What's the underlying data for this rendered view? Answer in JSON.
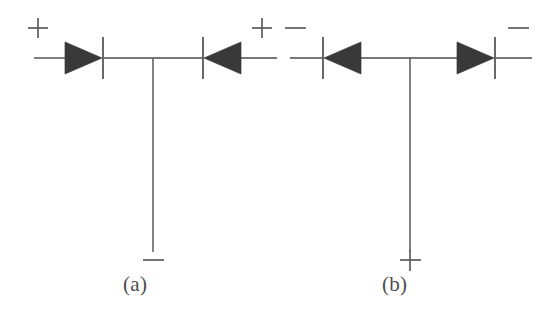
{
  "figure": {
    "background_color": "#ffffff",
    "ink_color": "#3c3c3c",
    "width": 557,
    "height": 326
  },
  "panels": [
    {
      "id": "a",
      "caption": "(a)",
      "caption_x": 123,
      "caption_y": 272,
      "baseline_y": 58,
      "wire_left_x": 34,
      "wire_right_x": 277,
      "junction_x": 153,
      "junction_bottom_y": 252,
      "terminals": [
        {
          "name": "left-terminal",
          "sign": "+",
          "sign_label": "plus",
          "x": 38,
          "y": 28
        },
        {
          "name": "right-terminal",
          "sign": "+",
          "sign_label": "plus",
          "x": 262,
          "y": 28
        },
        {
          "name": "bottom-terminal",
          "sign": "−",
          "sign_label": "minus",
          "x": 153,
          "y": 260
        }
      ],
      "diodes": [
        {
          "name": "diode-a-left",
          "direction": "right",
          "anode_x": 65,
          "tip_x": 102,
          "bar_x": 103,
          "half_height": 16,
          "bar_half_height": 21
        },
        {
          "name": "diode-a-right",
          "direction": "left",
          "anode_x": 241,
          "tip_x": 204,
          "bar_x": 203,
          "half_height": 16,
          "bar_half_height": 21
        }
      ]
    },
    {
      "id": "b",
      "caption": "(b)",
      "caption_x": 382,
      "caption_y": 272,
      "baseline_y": 58,
      "wire_left_x": 290,
      "wire_right_x": 532,
      "junction_x": 410,
      "junction_bottom_y": 252,
      "terminals": [
        {
          "name": "left-terminal",
          "sign": "−",
          "sign_label": "minus",
          "x": 295,
          "y": 28
        },
        {
          "name": "right-terminal",
          "sign": "−",
          "sign_label": "minus",
          "x": 518,
          "y": 28
        },
        {
          "name": "bottom-terminal",
          "sign": "+",
          "sign_label": "plus",
          "x": 410,
          "y": 260
        }
      ],
      "diodes": [
        {
          "name": "diode-b-left",
          "direction": "left",
          "anode_x": 361,
          "tip_x": 324,
          "bar_x": 323,
          "half_height": 16,
          "bar_half_height": 21
        },
        {
          "name": "diode-b-right",
          "direction": "right",
          "anode_x": 457,
          "tip_x": 494,
          "bar_x": 495,
          "half_height": 16,
          "bar_half_height": 21
        }
      ]
    }
  ],
  "captions": {
    "panel_a": "(a)",
    "panel_b": "(b)"
  },
  "signs": {
    "plus": "+",
    "minus": "−"
  }
}
